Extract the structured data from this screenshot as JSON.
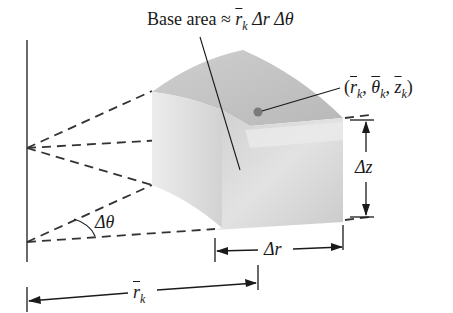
{
  "diagram": {
    "title_label": {
      "prefix": "Base area ≈ ",
      "r": "r",
      "r_sub": "k",
      "rest": " Δr Δθ"
    },
    "point_label": {
      "open": "(",
      "r": "r",
      "r_sub": "k",
      "sep1": ", ",
      "theta": "θ",
      "theta_sub": "k",
      "sep2": ", ",
      "z": "z",
      "z_sub": "k",
      "close": ")"
    },
    "dimension_labels": {
      "delta_z": "Δz",
      "delta_r": "Δr",
      "delta_theta": "Δθ",
      "r_bar": "r",
      "r_bar_sub": "k"
    },
    "colors": {
      "line": "#1a1a1a",
      "dash": "#3a3a3a",
      "solid_top": "#bdbdbd",
      "solid_left": "#e6e6e6",
      "solid_front": "#cfcfcf",
      "point": "#7a7a7a"
    }
  }
}
